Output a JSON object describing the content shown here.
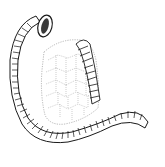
{
  "figure": {
    "colors": {
      "background": "#ffffff",
      "stroke": "#1a1a1a",
      "cell_stroke": "#8a8a8a",
      "lumen_fill": "#3a3a3a"
    }
  }
}
